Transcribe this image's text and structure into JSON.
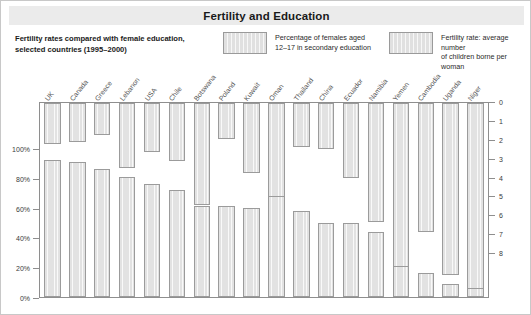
{
  "header": {
    "title": "Fertility and Education"
  },
  "subtitle": "Fertility rates compared with female education, selected countries (1995–2000)",
  "legend": {
    "education": {
      "label": "Percentage of females aged\n12–17 in secondary education",
      "color": "#e2e2e2"
    },
    "fertility": {
      "label": "Fertility rate: average number\nof children borne per woman",
      "color": "#e2e2e2"
    }
  },
  "axes": {
    "left": {
      "ticks": [
        "100%",
        "80%",
        "60%",
        "40%",
        "20%",
        "0%"
      ],
      "values": [
        100,
        80,
        60,
        40,
        20,
        0
      ],
      "min": 0,
      "max": 100
    },
    "right": {
      "ticks": [
        "0",
        "1",
        "2",
        "3",
        "4",
        "5",
        "6",
        "7",
        "8"
      ],
      "values": [
        0,
        1,
        2,
        3,
        4,
        5,
        6,
        7,
        8
      ],
      "min": 0,
      "max": 8,
      "inverted": true
    }
  },
  "chart_data": {
    "type": "bar",
    "title": "Fertility and Education",
    "subtitle": "Fertility rates compared with female education, selected countries (1995–2000)",
    "xlabel": "",
    "ylabel": "Percentage of females aged 12–17 in secondary education",
    "y2label": "Fertility rate: average number of children borne per woman",
    "ylim": [
      0,
      100
    ],
    "y2lim": [
      0,
      8
    ],
    "y2_inverted": true,
    "grid": false,
    "legend_position": "top",
    "categories": [
      "UK",
      "Canada",
      "Greece",
      "Lebanon",
      "USA",
      "Chile",
      "Botswana",
      "Poland",
      "Kuwait",
      "Oman",
      "Thailand",
      "China",
      "Ecuador",
      "Namibia",
      "Yemen",
      "Cambodia",
      "Uganda",
      "Niger"
    ],
    "series": [
      {
        "name": "Percentage of females aged 12–17 in secondary education",
        "axis": "left",
        "unit": "%",
        "values": [
          92,
          91,
          86,
          81,
          76,
          72,
          61,
          61,
          60,
          68,
          58,
          50,
          50,
          44,
          21,
          16,
          9,
          6
        ]
      },
      {
        "name": "Fertility rate: average number of children borne per woman",
        "axis": "right",
        "unit": "children per woman",
        "values": [
          1.7,
          1.6,
          1.3,
          2.7,
          2.0,
          2.4,
          4.2,
          1.5,
          2.9,
          6.1,
          1.8,
          1.9,
          3.1,
          4.9,
          7.6,
          5.3,
          7.1,
          8.0
        ]
      }
    ]
  }
}
